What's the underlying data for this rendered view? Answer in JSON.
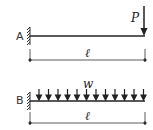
{
  "diagram": {
    "panels": [
      {
        "id": "A",
        "label": "A",
        "support": "fixed-wall",
        "load_type": "point-load",
        "load_label": "P",
        "span_label": "ℓ"
      },
      {
        "id": "B",
        "label": "B",
        "support": "fixed-wall",
        "load_type": "uniform-distributed-load",
        "load_label": "w",
        "span_label": "ℓ",
        "arrow_count": 12
      }
    ],
    "colors": {
      "line": "#222222",
      "text": "#333333"
    }
  }
}
